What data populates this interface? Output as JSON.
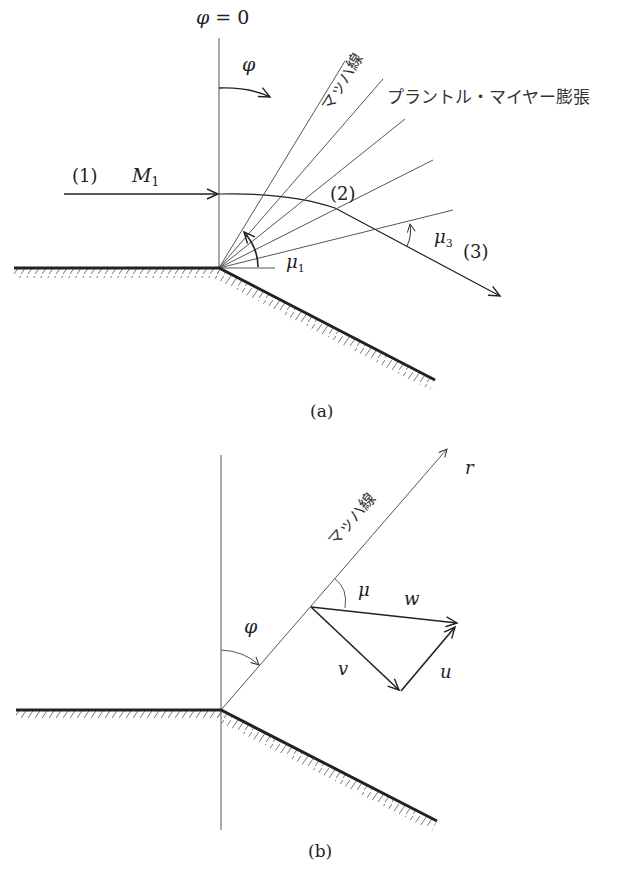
{
  "figure_a": {
    "caption": "(a)",
    "axis_label": "φ = 0",
    "phi_label": "φ",
    "region_1": "(1)",
    "mach_1": "M",
    "mach_1_sub": "1",
    "region_2": "(2)",
    "region_3": "(3)",
    "mu_1": "μ",
    "mu_1_sub": "1",
    "mu_3": "μ",
    "mu_3_sub": "3",
    "mach_line_label": "マッハ線",
    "expansion_label": "プラントル・マイヤー膨張"
  },
  "figure_b": {
    "caption": "(b)",
    "phi_label": "φ",
    "r_label": "r",
    "mu_label": "μ",
    "w_label": "w",
    "v_label": "v",
    "u_label": "u",
    "mach_line_label": "マッハ線"
  },
  "colors": {
    "ink": "#222222",
    "thin_line": "#555555",
    "hatch": "#777777"
  }
}
